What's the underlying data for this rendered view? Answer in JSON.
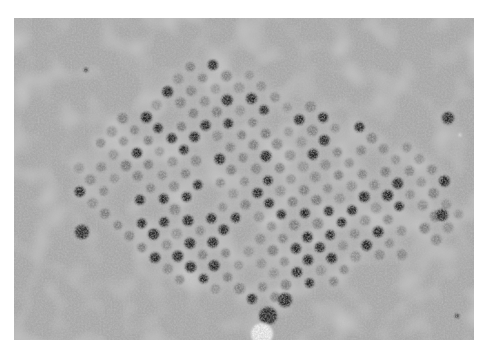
{
  "image": {
    "subject": "Transmission electron micrograph of a crystalline array of viral particles in cytoplasm",
    "canvas": {
      "width": 490,
      "height": 355,
      "background": "#ffffff"
    },
    "frame": {
      "x": 14,
      "y": 18,
      "width": 460,
      "height": 322
    },
    "tones": {
      "background_gray": "#a8a8a8",
      "light_gray": "#d6d6d6",
      "particle_dark": "#1e1e1e",
      "particle_mid": "#6a6a6a",
      "bright_spot": "#f2f2f2"
    },
    "lattice": {
      "origin": [
        190,
        67
      ],
      "vector_a": [
        12.5,
        11
      ],
      "vector_b": [
        -11,
        12.5
      ],
      "particle_radius": 5,
      "region_polygon": [
        [
          185,
          55
        ],
        [
          260,
          70
        ],
        [
          330,
          110
        ],
        [
          420,
          150
        ],
        [
          470,
          210
        ],
        [
          450,
          240
        ],
        [
          380,
          270
        ],
        [
          300,
          290
        ],
        [
          250,
          305
        ],
        [
          200,
          290
        ],
        [
          140,
          260
        ],
        [
          80,
          200
        ],
        [
          60,
          165
        ],
        [
          100,
          130
        ],
        [
          150,
          90
        ]
      ]
    },
    "features": [
      {
        "type": "dark-blob",
        "x": 448,
        "y": 118,
        "r": 6
      },
      {
        "type": "dark-blob",
        "x": 82,
        "y": 232,
        "r": 7
      },
      {
        "type": "dark-blob",
        "x": 268,
        "y": 316,
        "r": 9
      },
      {
        "type": "dark-blob",
        "x": 285,
        "y": 300,
        "r": 7
      },
      {
        "type": "dark-blob",
        "x": 442,
        "y": 215,
        "r": 6
      },
      {
        "type": "small-dot",
        "x": 86,
        "y": 70,
        "r": 2
      },
      {
        "type": "small-dot",
        "x": 457,
        "y": 316,
        "r": 2
      },
      {
        "type": "bright-spot",
        "x": 262,
        "y": 334,
        "r": 11
      },
      {
        "type": "bright-spot",
        "x": 460,
        "y": 135,
        "r": 1.5
      }
    ]
  }
}
